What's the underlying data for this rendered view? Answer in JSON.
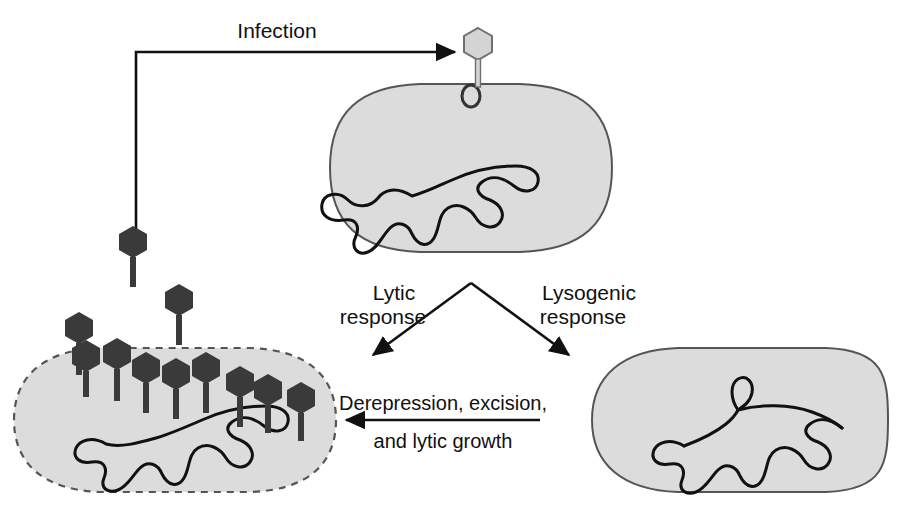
{
  "figure": {
    "background_color": "#ffffff"
  },
  "colors": {
    "cell_fill": "#dcdcdc",
    "cell_stroke": "#555555",
    "phage_dark": "#3a3a3a",
    "phage_light": "#d4d4d4",
    "phage_light_stroke": "#6f6f6f",
    "chromosome_stroke": "#111111",
    "arrow_color": "#111111",
    "text_color": "#111111"
  },
  "labels": {
    "infection": "Infection",
    "lytic_line1": "Lytic",
    "lytic_line2": "response",
    "lysogenic_line1": "Lysogenic",
    "lysogenic_line2": "response",
    "derepression_line1": "Derepression, excision,",
    "derepression_line2": "and lytic growth"
  },
  "cells": [
    {
      "id": "infected-cell",
      "name": "infected-host-cell",
      "outline": "solid",
      "has_receptor": true,
      "has_attached_phage": true,
      "chromosome": "free-circular-chromosome"
    },
    {
      "id": "lysing-cell",
      "name": "lysing-host-cell",
      "outline": "dashed",
      "has_receptor": false,
      "has_attached_phage": false,
      "chromosome": "free-circular-chromosome",
      "progeny_phage_count": 13
    },
    {
      "id": "lysogenic-cell",
      "name": "lysogenic-host-cell",
      "outline": "solid",
      "has_receptor": false,
      "has_attached_phage": false,
      "chromosome": "chromosome-with-integrated-prophage"
    }
  ],
  "arrows": [
    {
      "name": "infection-arrow",
      "from": "released-phage-cluster",
      "to": "free-phage",
      "label": "Infection",
      "direction": "right"
    },
    {
      "name": "lytic-arrow",
      "from": "infected-cell",
      "to": "lysing-cell",
      "label": "Lytic response",
      "direction": "down-left"
    },
    {
      "name": "lysogenic-arrow",
      "from": "infected-cell",
      "to": "lysogenic-cell",
      "label": "Lysogenic response",
      "direction": "down-right"
    },
    {
      "name": "derepression-arrow",
      "from": "lysogenic-cell",
      "to": "lysing-cell",
      "label": "Derepression, excision, and lytic growth",
      "direction": "left"
    }
  ],
  "phages": {
    "free_phage": {
      "x": 478,
      "y": 44,
      "shade": "light"
    },
    "infecting_cluster": [
      {
        "x": 133,
        "y": 240
      },
      {
        "x": 79,
        "y": 322
      },
      {
        "x": 155,
        "y": 295
      }
    ],
    "progeny": [
      {
        "x": 76,
        "y": 344
      },
      {
        "x": 110,
        "y": 374
      },
      {
        "x": 139,
        "y": 354
      },
      {
        "x": 162,
        "y": 358
      },
      {
        "x": 200,
        "y": 368
      },
      {
        "x": 232,
        "y": 362
      },
      {
        "x": 268,
        "y": 378
      },
      {
        "x": 196,
        "y": 324
      }
    ]
  }
}
